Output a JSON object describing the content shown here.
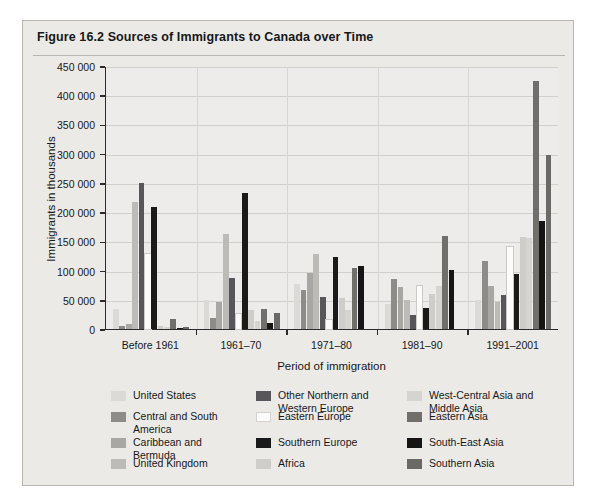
{
  "figure": {
    "number": "Figure 16.2",
    "title": "Figure 16.2  Sources of Immigrants to Canada over Time"
  },
  "chart_data": {
    "type": "bar",
    "title": "Sources of Immigrants to Canada over Time",
    "xlabel": "Period of immigration",
    "ylabel": "Immigrants in thousands",
    "ylim": [
      0,
      450000
    ],
    "ytick_values": [
      0,
      50000,
      100000,
      150000,
      200000,
      250000,
      300000,
      350000,
      400000,
      450000
    ],
    "ytick_labels": [
      "0",
      "50 000",
      "100 000",
      "150 000",
      "200 000",
      "250 000",
      "300 000",
      "350 000",
      "400 000",
      "450 000"
    ],
    "grid": true,
    "legend_position": "bottom",
    "categories": [
      "Before 1961",
      "1961–70",
      "1971–80",
      "1981–90",
      "1991–2001"
    ],
    "series": [
      {
        "name": "United States",
        "color": "#dcdad7",
        "values": [
          34000,
          50000,
          77000,
          43000,
          50000
        ]
      },
      {
        "name": "Central and South\nAmerica",
        "color": "#8e8c89",
        "values": [
          6000,
          19000,
          67000,
          85000,
          117000
        ]
      },
      {
        "name": "Caribbean and\nBermuda",
        "color": "#a9a7a4",
        "values": [
          9000,
          47000,
          96000,
          72000,
          73000
        ]
      },
      {
        "name": "United Kingdom",
        "color": "#bdbbb8",
        "values": [
          217000,
          162000,
          128000,
          50000,
          46000
        ]
      },
      {
        "name": "Other Northern and\nWestern Europe",
        "color": "#58565a",
        "values": [
          250000,
          87000,
          54000,
          24000,
          58000
        ]
      },
      {
        "name": "Eastern Europe",
        "color": "#fbfbf9",
        "values": [
          128000,
          25000,
          16000,
          73000,
          141000
        ]
      },
      {
        "name": "Southern Europe",
        "color": "#1a1a1a",
        "values": [
          208000,
          232000,
          124000,
          36000,
          94000
        ]
      },
      {
        "name": "Africa",
        "color": "#cfcdca",
        "values": [
          5000,
          32000,
          53000,
          60000,
          157000
        ]
      },
      {
        "name": "West-Central Asia and\nMiddle Asia",
        "color": "#d6d4d1",
        "values": [
          4000,
          14000,
          33000,
          73000,
          156000
        ]
      },
      {
        "name": "Eastern Asia",
        "color": "#716f6c",
        "values": [
          17000,
          35000,
          105000,
          160000,
          425000
        ]
      },
      {
        "name": "South-East Asia",
        "color": "#151515",
        "values": [
          2000,
          10000,
          108000,
          101000,
          184000
        ]
      },
      {
        "name": "Southern Asia",
        "color": "#6b6966",
        "values": [
          3000,
          27000,
          0,
          0,
          297000
        ]
      }
    ]
  },
  "legend": {
    "columns": [
      [
        {
          "label": "United States",
          "color": "#dcdad7"
        },
        {
          "label": "Central and South\nAmerica",
          "color": "#8e8c89"
        },
        {
          "label": "Caribbean and\nBermuda",
          "color": "#a9a7a4"
        },
        {
          "label": "United Kingdom",
          "color": "#bdbbb8"
        }
      ],
      [
        {
          "label": "Other Northern and\nWestern Europe",
          "color": "#58565a"
        },
        {
          "label": "Eastern Europe",
          "color": "#fbfbf9"
        },
        {
          "label": "Southern Europe",
          "color": "#1a1a1a"
        },
        {
          "label": "Africa",
          "color": "#cfcdca"
        }
      ],
      [
        {
          "label": "West-Central Asia and\nMiddle Asia",
          "color": "#d6d4d1"
        },
        {
          "label": "Eastern Asia",
          "color": "#716f6c"
        },
        {
          "label": "South-East Asia",
          "color": "#151515"
        },
        {
          "label": "Southern Asia",
          "color": "#6b6966"
        }
      ]
    ]
  }
}
